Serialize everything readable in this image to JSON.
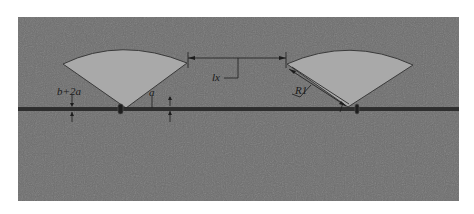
{
  "figure": {
    "type": "sprinkler-layout-diagram",
    "colors": {
      "background_panel": "#6e6e6e",
      "fan_fill": "#a9a9a9",
      "fan_edge": "#3a3a3a",
      "pipe": "#2e2e2e",
      "dimension_line": "#1c1c1c",
      "page": "#ffffff"
    },
    "labels": {
      "pipe_width_label": "b+2a",
      "offset_label": "a",
      "spacing_label": "lx",
      "radius_label": "R1"
    },
    "sprinklers": [
      {
        "id": "left",
        "name": "left-sprinkler"
      },
      {
        "id": "right",
        "name": "right-sprinkler"
      }
    ]
  }
}
